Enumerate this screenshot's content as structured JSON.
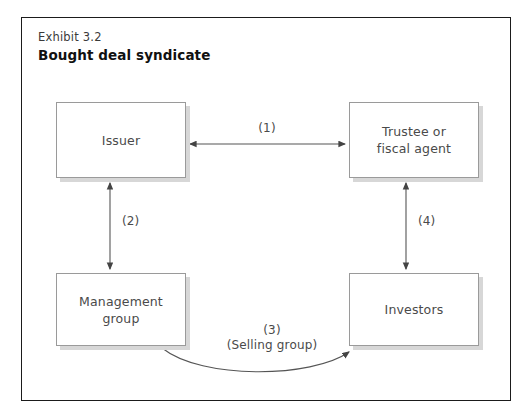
{
  "exhibit": {
    "number_label": "Exhibit 3.2",
    "title": "Bought deal syndicate"
  },
  "nodes": [
    {
      "id": "issuer",
      "label": "Issuer"
    },
    {
      "id": "trustee",
      "label": "Trustee or\nfiscal agent"
    },
    {
      "id": "management",
      "label": "Management\ngroup"
    },
    {
      "id": "investors",
      "label": "Investors"
    }
  ],
  "edges": [
    {
      "id": "edge-1",
      "label": "(1)",
      "from": "issuer",
      "to": "trustee",
      "style": "double-headed-straight",
      "orientation": "horizontal"
    },
    {
      "id": "edge-2",
      "label": "(2)",
      "from": "issuer",
      "to": "management",
      "style": "double-headed-straight",
      "orientation": "vertical"
    },
    {
      "id": "edge-3",
      "label": "(3)\n(Selling group)",
      "from": "management",
      "to": "investors",
      "style": "single-headed-curved",
      "orientation": "curved"
    },
    {
      "id": "edge-4",
      "label": "(4)",
      "from": "trustee",
      "to": "investors",
      "style": "double-headed-straight",
      "orientation": "vertical"
    }
  ],
  "colors": {
    "frame_border": "#1b1b1b",
    "box_border": "#9a9a9a",
    "box_shadow": "#d7d7d7",
    "text": "#4a4a4a",
    "title_text": "#111111",
    "connector": "#555555",
    "background": "#ffffff"
  }
}
